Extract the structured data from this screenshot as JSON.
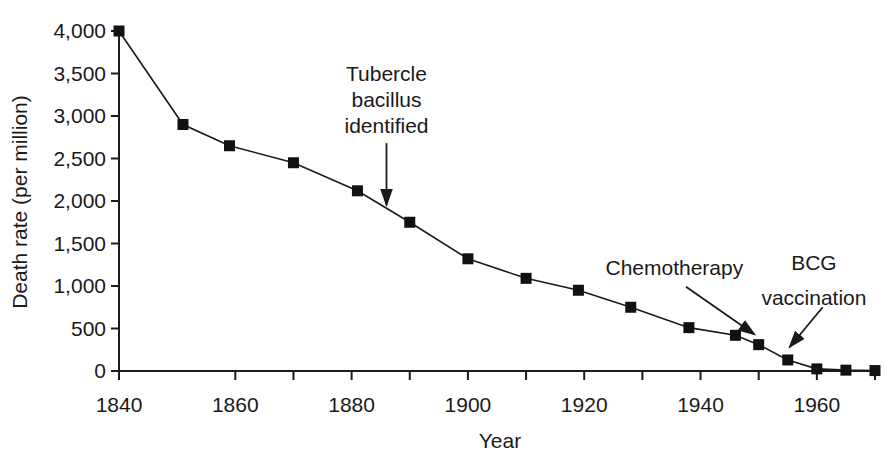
{
  "chart_data": {
    "type": "line",
    "title": "",
    "xlabel": "Year",
    "ylabel": "Death rate (per million)",
    "x_range": [
      1840,
      1970
    ],
    "y_range": [
      0,
      4000
    ],
    "grid": false,
    "legend": "none",
    "marker": "filled-square",
    "colors": {
      "line": "#1a1a1a",
      "marker": "#111111",
      "axis": "#1a1a1a",
      "text": "#1a1a1a",
      "background": "#ffffff"
    },
    "x_tick_marks": [
      1840,
      1860,
      1870,
      1880,
      1890,
      1900,
      1910,
      1920,
      1930,
      1940,
      1950,
      1960,
      1970
    ],
    "x_tick_labels": [
      {
        "year": 1840,
        "label": "1840"
      },
      {
        "year": 1860,
        "label": "1860"
      },
      {
        "year": 1880,
        "label": "1880"
      },
      {
        "year": 1900,
        "label": "1900"
      },
      {
        "year": 1920,
        "label": "1920"
      },
      {
        "year": 1940,
        "label": "1940"
      },
      {
        "year": 1960,
        "label": "1960"
      }
    ],
    "y_ticks": [
      {
        "value": 0,
        "label": "0"
      },
      {
        "value": 500,
        "label": "500"
      },
      {
        "value": 1000,
        "label": "1,000"
      },
      {
        "value": 1500,
        "label": "1,500"
      },
      {
        "value": 2000,
        "label": "2,000"
      },
      {
        "value": 2500,
        "label": "2,500"
      },
      {
        "value": 3000,
        "label": "3,000"
      },
      {
        "value": 3500,
        "label": "3,500"
      },
      {
        "value": 4000,
        "label": "4,000"
      }
    ],
    "points": [
      {
        "year": 1840,
        "value": 4000
      },
      {
        "year": 1851,
        "value": 2900
      },
      {
        "year": 1859,
        "value": 2650
      },
      {
        "year": 1870,
        "value": 2450
      },
      {
        "year": 1881,
        "value": 2120
      },
      {
        "year": 1890,
        "value": 1750
      },
      {
        "year": 1900,
        "value": 1320
      },
      {
        "year": 1910,
        "value": 1090
      },
      {
        "year": 1919,
        "value": 950
      },
      {
        "year": 1928,
        "value": 750
      },
      {
        "year": 1938,
        "value": 510
      },
      {
        "year": 1946,
        "value": 420
      },
      {
        "year": 1950,
        "value": 310
      },
      {
        "year": 1955,
        "value": 130
      },
      {
        "year": 1960,
        "value": 25
      },
      {
        "year": 1965,
        "value": 10
      },
      {
        "year": 1970,
        "value": 5
      }
    ],
    "annotations": [
      {
        "id": "tubercle",
        "lines": [
          "Tubercle",
          "bacillus",
          "identified"
        ],
        "label_at": {
          "year": 1886,
          "value": 3190
        },
        "arrow": {
          "from": {
            "year": 1886,
            "value": 2680
          },
          "to": {
            "year": 1886,
            "value": 1950
          }
        }
      },
      {
        "id": "chemotherapy",
        "lines": [
          "Chemotherapy"
        ],
        "label_at": {
          "year": 1935.5,
          "value": 1210
        },
        "arrow": {
          "from": {
            "year": 1937.5,
            "value": 990
          },
          "to": {
            "year": 1949.3,
            "value": 430
          }
        }
      },
      {
        "id": "bcg",
        "lines": [
          "BCG",
          "vaccination"
        ],
        "label_at": {
          "year": 1959.5,
          "value": 1075
        },
        "arrow": {
          "from": {
            "year": 1961,
            "value": 750
          },
          "to": {
            "year": 1955.3,
            "value": 280
          }
        }
      }
    ]
  }
}
